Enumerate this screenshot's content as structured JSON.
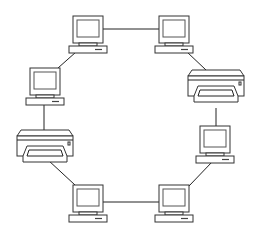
{
  "diagram": {
    "type": "ring-network-topology",
    "nodes": [
      {
        "id": "pc-top-left",
        "kind": "computer",
        "x": 88,
        "y": 34
      },
      {
        "id": "pc-top-right",
        "kind": "computer",
        "x": 174,
        "y": 34
      },
      {
        "id": "printer-right",
        "kind": "printer",
        "x": 215,
        "y": 89
      },
      {
        "id": "pc-right",
        "kind": "computer",
        "x": 215,
        "y": 144
      },
      {
        "id": "pc-bottom-right",
        "kind": "computer",
        "x": 174,
        "y": 203
      },
      {
        "id": "pc-bottom-left",
        "kind": "computer",
        "x": 88,
        "y": 203
      },
      {
        "id": "printer-left",
        "kind": "printer",
        "x": 45,
        "y": 145
      },
      {
        "id": "pc-left",
        "kind": "computer",
        "x": 45,
        "y": 86
      }
    ],
    "edges": [
      [
        "pc-top-left",
        "pc-top-right"
      ],
      [
        "pc-top-right",
        "printer-right"
      ],
      [
        "printer-right",
        "pc-right"
      ],
      [
        "pc-right",
        "pc-bottom-right"
      ],
      [
        "pc-bottom-right",
        "pc-bottom-left"
      ],
      [
        "pc-bottom-left",
        "printer-left"
      ],
      [
        "printer-left",
        "pc-left"
      ],
      [
        "pc-left",
        "pc-top-left"
      ]
    ],
    "colors": {
      "stroke": "#333333",
      "background": "#ffffff"
    }
  }
}
